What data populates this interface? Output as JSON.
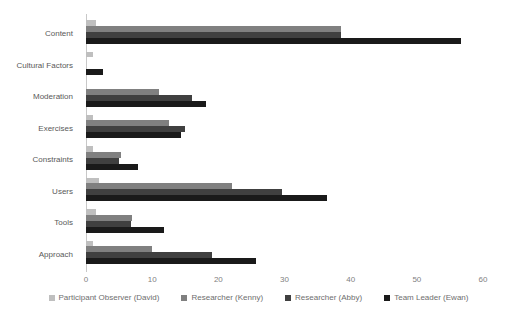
{
  "chart_data": {
    "type": "bar",
    "orientation": "horizontal",
    "title": "",
    "xlabel": "",
    "ylabel": "",
    "xlim": [
      0,
      60
    ],
    "xticks": [
      0,
      10,
      20,
      30,
      40,
      50,
      60
    ],
    "grid": false,
    "legend_position": "bottom",
    "categories": [
      "Content",
      "Cultural Factors",
      "Moderation",
      "Exercises",
      "Constraints",
      "Users",
      "Tools",
      "Approach"
    ],
    "series": [
      {
        "name": "Participant Observer (David)",
        "color": "#bfbfbf",
        "values": [
          1.5,
          1.0,
          0.0,
          1.0,
          1.0,
          2.0,
          1.5,
          1.0
        ]
      },
      {
        "name": "Researcher (Kenny)",
        "color": "#808080",
        "values": [
          38.5,
          0.0,
          11.0,
          12.5,
          5.3,
          22.0,
          7.0,
          10.0
        ]
      },
      {
        "name": "Researcher (Abby)",
        "color": "#404040",
        "values": [
          38.5,
          0.0,
          16.0,
          15.0,
          5.0,
          29.6,
          6.8,
          19.0
        ]
      },
      {
        "name": "Team Leader (Ewan)",
        "color": "#1a1a1a",
        "values": [
          56.6,
          2.5,
          18.2,
          14.4,
          7.8,
          36.4,
          11.8,
          25.7
        ]
      }
    ]
  },
  "axis": {
    "tick_labels": [
      "0",
      "10",
      "20",
      "30",
      "40",
      "50",
      "60"
    ]
  },
  "legend": {
    "items": [
      {
        "label": "Participant Observer (David)",
        "color": "#bfbfbf"
      },
      {
        "label": "Researcher (Kenny)",
        "color": "#808080"
      },
      {
        "label": "Researcher (Abby)",
        "color": "#404040"
      },
      {
        "label": "Team Leader (Ewan)",
        "color": "#1a1a1a"
      }
    ]
  },
  "colors": {
    "background": "#ffffff",
    "axis_line": "#c8c8c8",
    "tick_text": "#7f7f7f",
    "category_text": "#595959",
    "legend_text": "#6e6e6e"
  }
}
